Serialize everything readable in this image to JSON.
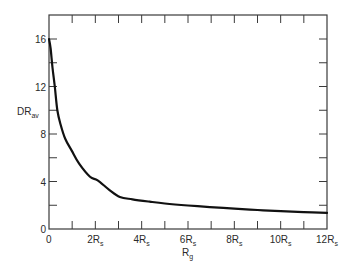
{
  "chart_data": {
    "type": "line",
    "title": "",
    "xlabel": "R",
    "xlabel_subscript": "g",
    "ylabel": "DR",
    "ylabel_subscript": "av",
    "xlim": [
      0,
      12
    ],
    "ylim": [
      0,
      18
    ],
    "grid": false,
    "legend": null,
    "x_ticks": [
      {
        "value": 0,
        "label": "0",
        "sub": ""
      },
      {
        "value": 2,
        "label": "2R",
        "sub": "s"
      },
      {
        "value": 4,
        "label": "4R",
        "sub": "s"
      },
      {
        "value": 6,
        "label": "6R",
        "sub": "s"
      },
      {
        "value": 8,
        "label": "8R",
        "sub": "s"
      },
      {
        "value": 10,
        "label": "10R",
        "sub": "s"
      },
      {
        "value": 12,
        "label": "12R",
        "sub": "s"
      }
    ],
    "x_minor_step": 1,
    "y_ticks": [
      {
        "value": 0,
        "label": "0"
      },
      {
        "value": 4,
        "label": "4"
      },
      {
        "value": 8,
        "label": "8"
      },
      {
        "value": 12,
        "label": "12"
      },
      {
        "value": 16,
        "label": "16"
      }
    ],
    "y_minor_step": 2,
    "x_units": "R_s",
    "series": [
      {
        "name": "DR_av vs R_g",
        "color": "#111111",
        "x": [
          0,
          0.07,
          0.15,
          0.25,
          0.36,
          0.5,
          0.7,
          0.98,
          1.3,
          1.77,
          2.1,
          2.6,
          3.06,
          3.6,
          4.35,
          5.0,
          6.0,
          6.94,
          8.0,
          9.0,
          10.0,
          11.0,
          12.0
        ],
        "y": [
          16.0,
          15.2,
          13.6,
          12.0,
          10.0,
          8.8,
          7.6,
          6.6,
          5.5,
          4.4,
          4.1,
          3.3,
          2.7,
          2.5,
          2.3,
          2.15,
          1.98,
          1.85,
          1.72,
          1.6,
          1.5,
          1.42,
          1.35
        ]
      }
    ]
  },
  "layout": {
    "frame": {
      "left": 49,
      "top": 15,
      "right": 327,
      "bottom": 229
    }
  }
}
